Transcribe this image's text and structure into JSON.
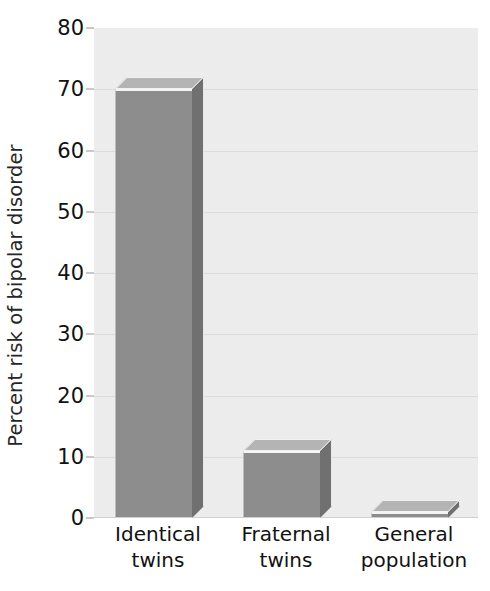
{
  "chart_data": {
    "type": "bar",
    "title": "",
    "subtitle": "",
    "xlabel": "",
    "ylabel": "Percent risk of bipolar disorder",
    "categories": [
      "Identical twins",
      "Fraternal twins",
      "General population"
    ],
    "category_lines": [
      [
        "Identical",
        "twins"
      ],
      [
        "Fraternal",
        "twins"
      ],
      [
        "General",
        "population"
      ]
    ],
    "values": [
      70,
      11,
      1
    ],
    "ylim": [
      0,
      80
    ],
    "ytick_values": [
      0,
      10,
      20,
      30,
      40,
      50,
      60,
      70,
      80
    ],
    "ytick_labels": [
      "0",
      "10",
      "20",
      "30",
      "40",
      "50",
      "60",
      "70",
      "80"
    ],
    "ytick_step": 10,
    "grid": true,
    "grid_axis": "y",
    "legend": false,
    "legend_position": "none",
    "bar_style": "3d",
    "colors": {
      "plot_background": "#ececec",
      "figure_background": "#ffffff",
      "gridline": "#dcdcdc",
      "bar_front": "#8d8d8d",
      "bar_top": "#b4b4b4",
      "bar_side": "#707070",
      "bar_highlight": "#f4f4f4",
      "text": "#111111"
    }
  }
}
